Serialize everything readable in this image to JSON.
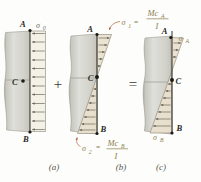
{
  "figure_title": "superposition-of-stresses-diagram",
  "colors": {
    "background": "#fdfdfb",
    "beam_fill_light": "#dededa",
    "beam_fill_dark": "#aeaea6",
    "beam_edge": "#9c9c94",
    "stress_fill": "#e9e1cd",
    "stress_edge": "#8a8376",
    "arrow": "#6e685c",
    "section_line": "#33332f",
    "point_label": "#2a2a26",
    "sigma_plain": "#6e6e68",
    "equation": "#8c7d4d",
    "leader": "#b06040",
    "caption": "#55554f",
    "operator": "#3a3a36"
  },
  "panel_a": {
    "point_top": "A",
    "point_mid": "C",
    "point_bottom": "B",
    "sigma_symbol": "σ",
    "sigma_subscript": "0",
    "caption": "(a)"
  },
  "operators": {
    "plus": "+",
    "equals": "="
  },
  "panel_b": {
    "point_top": "A",
    "point_mid": "C",
    "point_bottom": "B",
    "caption": "(b)",
    "sigma1": {
      "symbol": "σ",
      "subscript": "1",
      "equals": "=",
      "numerator": "Mc",
      "numerator_subscript": "A",
      "denominator": "I"
    },
    "sigma2": {
      "symbol": "σ",
      "subscript": "2",
      "equals": "=",
      "numerator": "Mc",
      "numerator_subscript": "B",
      "denominator": "I"
    }
  },
  "panel_c": {
    "point_top": "A",
    "point_mid": "C",
    "point_bottom": "B",
    "caption": "(c)",
    "sigma_top": {
      "symbol": "σ",
      "subscript": "A"
    },
    "sigma_bottom": {
      "symbol": "σ",
      "subscript": "B"
    }
  }
}
